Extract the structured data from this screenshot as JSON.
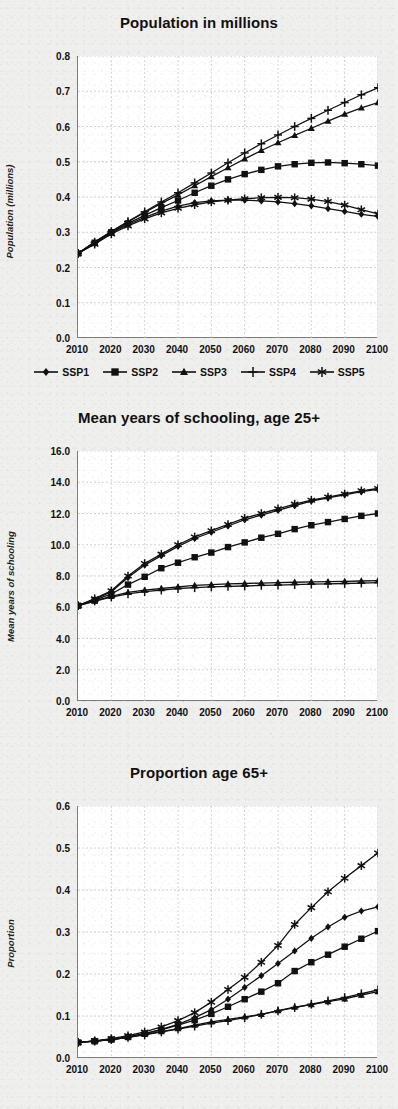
{
  "figure": {
    "series_names": [
      "SSP1",
      "SSP2",
      "SSP3",
      "SSP4",
      "SSP5"
    ],
    "series_markers": [
      "diamond-marker",
      "square-marker",
      "triangle-marker",
      "plus-marker",
      "asterisk-marker"
    ],
    "line_color": "#111111",
    "plot_background": "#ffffff",
    "page_background": "#efefed",
    "grid": "dotted light-gray"
  },
  "legend": {
    "items": [
      {
        "label": "SSP1",
        "marker": "diamond-marker"
      },
      {
        "label": "SSP2",
        "marker": "square-marker"
      },
      {
        "label": "SSP3",
        "marker": "triangle-marker"
      },
      {
        "label": "SSP4",
        "marker": "plus-marker"
      },
      {
        "label": "SSP5",
        "marker": "asterisk-marker"
      }
    ]
  },
  "chart_data": [
    {
      "id": "population",
      "type": "line",
      "title": "Population in millions",
      "xlabel": "",
      "ylabel": "Population (millions)",
      "x": [
        2010,
        2015,
        2020,
        2025,
        2030,
        2035,
        2040,
        2045,
        2050,
        2055,
        2060,
        2065,
        2070,
        2075,
        2080,
        2085,
        2090,
        2095,
        2100
      ],
      "xticks": [
        2010,
        2020,
        2030,
        2040,
        2050,
        2060,
        2070,
        2080,
        2090,
        2100
      ],
      "yticks": [
        0.0,
        0.1,
        0.2,
        0.3,
        0.4,
        0.5,
        0.6,
        0.7,
        0.8
      ],
      "ytick_labels": [
        "0.0",
        "0.1",
        "0.2",
        "0.3",
        "0.4",
        "0.5",
        "0.6",
        "0.7",
        "0.8"
      ],
      "xlim": [
        2010,
        2100
      ],
      "ylim": [
        0.0,
        0.8
      ],
      "grid": true,
      "legend_position": "bottom",
      "series": [
        {
          "name": "SSP1",
          "marker": "diamond-marker",
          "values": [
            0.24,
            0.268,
            0.298,
            0.322,
            0.342,
            0.36,
            0.374,
            0.384,
            0.389,
            0.391,
            0.391,
            0.389,
            0.386,
            0.381,
            0.375,
            0.367,
            0.359,
            0.351,
            0.345
          ]
        },
        {
          "name": "SSP2",
          "marker": "square-marker",
          "values": [
            0.24,
            0.27,
            0.3,
            0.325,
            0.348,
            0.37,
            0.39,
            0.412,
            0.432,
            0.45,
            0.465,
            0.477,
            0.487,
            0.493,
            0.497,
            0.498,
            0.496,
            0.493,
            0.489
          ]
        },
        {
          "name": "SSP3",
          "marker": "triangle-marker",
          "values": [
            0.24,
            0.272,
            0.302,
            0.33,
            0.356,
            0.382,
            0.406,
            0.432,
            0.458,
            0.483,
            0.508,
            0.532,
            0.554,
            0.575,
            0.595,
            0.615,
            0.635,
            0.653,
            0.668
          ]
        },
        {
          "name": "SSP4",
          "marker": "plus-marker",
          "values": [
            0.24,
            0.272,
            0.302,
            0.33,
            0.358,
            0.386,
            0.412,
            0.44,
            0.468,
            0.497,
            0.525,
            0.551,
            0.576,
            0.6,
            0.623,
            0.646,
            0.668,
            0.69,
            0.71
          ]
        },
        {
          "name": "SSP5",
          "marker": "asterisk-marker",
          "values": [
            0.24,
            0.266,
            0.295,
            0.318,
            0.338,
            0.355,
            0.368,
            0.378,
            0.386,
            0.391,
            0.395,
            0.398,
            0.399,
            0.398,
            0.394,
            0.387,
            0.377,
            0.364,
            0.352
          ]
        }
      ]
    },
    {
      "id": "schooling",
      "type": "line",
      "title": "Mean years of schooling, age 25+",
      "xlabel": "",
      "ylabel": "Mean years of schooling",
      "x": [
        2010,
        2015,
        2020,
        2025,
        2030,
        2035,
        2040,
        2045,
        2050,
        2055,
        2060,
        2065,
        2070,
        2075,
        2080,
        2085,
        2090,
        2095,
        2100
      ],
      "xticks": [
        2010,
        2020,
        2030,
        2040,
        2050,
        2060,
        2070,
        2080,
        2090,
        2100
      ],
      "yticks": [
        0.0,
        2.0,
        4.0,
        6.0,
        8.0,
        10.0,
        12.0,
        14.0,
        16.0
      ],
      "ytick_labels": [
        "0.0",
        "2.0",
        "4.0",
        "6.0",
        "8.0",
        "10.0",
        "12.0",
        "14.0",
        "16.0"
      ],
      "xlim": [
        2010,
        2100
      ],
      "ylim": [
        0.0,
        16.0
      ],
      "grid": true,
      "legend_position": "none",
      "series": [
        {
          "name": "SSP1",
          "marker": "diamond-marker",
          "values": [
            6.1,
            6.5,
            7.0,
            7.9,
            8.7,
            9.3,
            9.9,
            10.4,
            10.8,
            11.2,
            11.6,
            11.9,
            12.2,
            12.5,
            12.8,
            13.0,
            13.2,
            13.4,
            13.55
          ]
        },
        {
          "name": "SSP2",
          "marker": "square-marker",
          "values": [
            6.1,
            6.45,
            6.85,
            7.45,
            7.95,
            8.5,
            8.85,
            9.2,
            9.5,
            9.85,
            10.15,
            10.45,
            10.7,
            11.0,
            11.25,
            11.45,
            11.65,
            11.85,
            12.0
          ]
        },
        {
          "name": "SSP3",
          "marker": "triangle-marker",
          "values": [
            6.1,
            6.4,
            6.7,
            6.95,
            7.1,
            7.2,
            7.3,
            7.4,
            7.45,
            7.5,
            7.52,
            7.55,
            7.58,
            7.6,
            7.62,
            7.64,
            7.66,
            7.68,
            7.7
          ]
        },
        {
          "name": "SSP4",
          "marker": "plus-marker",
          "values": [
            6.1,
            6.4,
            6.65,
            6.85,
            7.0,
            7.1,
            7.2,
            7.25,
            7.3,
            7.33,
            7.36,
            7.4,
            7.42,
            7.45,
            7.48,
            7.5,
            7.52,
            7.55,
            7.58
          ]
        },
        {
          "name": "SSP5",
          "marker": "asterisk-marker",
          "values": [
            6.1,
            6.55,
            7.05,
            8.0,
            8.8,
            9.4,
            10.0,
            10.5,
            10.9,
            11.3,
            11.7,
            12.0,
            12.3,
            12.6,
            12.85,
            13.05,
            13.25,
            13.45,
            13.6
          ]
        }
      ]
    },
    {
      "id": "proportion65",
      "type": "line",
      "title": "Proportion age 65+",
      "xlabel": "",
      "ylabel": "Proportion",
      "x": [
        2010,
        2015,
        2020,
        2025,
        2030,
        2035,
        2040,
        2045,
        2050,
        2055,
        2060,
        2065,
        2070,
        2075,
        2080,
        2085,
        2090,
        2095,
        2100
      ],
      "xticks": [
        2010,
        2020,
        2030,
        2040,
        2050,
        2060,
        2070,
        2080,
        2090,
        2100
      ],
      "yticks": [
        0.0,
        0.1,
        0.2,
        0.3,
        0.4,
        0.5,
        0.6
      ],
      "ytick_labels": [
        "0.0",
        "0.1",
        "0.2",
        "0.3",
        "0.4",
        "0.5",
        "0.6"
      ],
      "xlim": [
        2010,
        2100
      ],
      "ylim": [
        0.0,
        0.6
      ],
      "grid": true,
      "legend_position": "none",
      "series": [
        {
          "name": "SSP1",
          "marker": "diamond-marker",
          "values": [
            0.037,
            0.04,
            0.044,
            0.05,
            0.058,
            0.068,
            0.08,
            0.096,
            0.115,
            0.14,
            0.168,
            0.196,
            0.225,
            0.255,
            0.285,
            0.312,
            0.335,
            0.35,
            0.36
          ]
        },
        {
          "name": "SSP2",
          "marker": "square-marker",
          "values": [
            0.037,
            0.04,
            0.044,
            0.05,
            0.058,
            0.067,
            0.078,
            0.09,
            0.105,
            0.122,
            0.14,
            0.158,
            0.178,
            0.207,
            0.228,
            0.246,
            0.265,
            0.284,
            0.302
          ]
        },
        {
          "name": "SSP3",
          "marker": "triangle-marker",
          "values": [
            0.037,
            0.04,
            0.044,
            0.049,
            0.056,
            0.063,
            0.07,
            0.078,
            0.086,
            0.092,
            0.098,
            0.104,
            0.113,
            0.121,
            0.127,
            0.134,
            0.141,
            0.15,
            0.158
          ]
        },
        {
          "name": "SSP4",
          "marker": "plus-marker",
          "values": [
            0.037,
            0.04,
            0.044,
            0.049,
            0.055,
            0.062,
            0.069,
            0.076,
            0.083,
            0.089,
            0.096,
            0.104,
            0.112,
            0.12,
            0.128,
            0.136,
            0.144,
            0.153,
            0.162
          ]
        },
        {
          "name": "SSP5",
          "marker": "asterisk-marker",
          "values": [
            0.037,
            0.041,
            0.046,
            0.053,
            0.062,
            0.074,
            0.089,
            0.108,
            0.133,
            0.163,
            0.192,
            0.228,
            0.268,
            0.318,
            0.358,
            0.396,
            0.428,
            0.458,
            0.488
          ]
        }
      ]
    }
  ]
}
